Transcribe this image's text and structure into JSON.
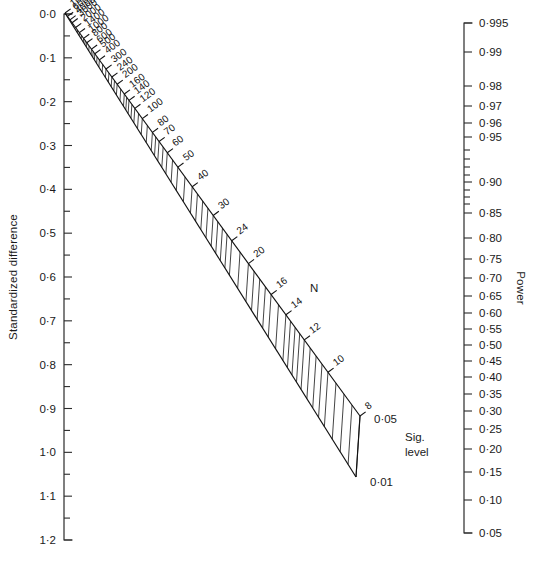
{
  "figure": {
    "type": "nomogram"
  },
  "left_axis": {
    "title": "Standardized difference",
    "y_top_px": 14,
    "y_bottom_px": 540,
    "range": [
      0.0,
      1.2
    ],
    "major_labels": [
      "0·0",
      "0·1",
      "0·2",
      "0·3",
      "0·4",
      "0·5",
      "0·6",
      "0·7",
      "0·8",
      "0·9",
      "1·0",
      "1·1",
      "1·2"
    ],
    "major_values": [
      0.0,
      0.1,
      0.2,
      0.3,
      0.4,
      0.5,
      0.6,
      0.7,
      0.8,
      0.9,
      1.0,
      1.1,
      1.2
    ],
    "minor_values": [
      0.05,
      0.15,
      0.25,
      0.35,
      0.45,
      0.55,
      0.65,
      0.75,
      0.85,
      0.95,
      1.05,
      1.15
    ]
  },
  "right_axis": {
    "title": "Power",
    "y_top_px": 23,
    "y_bottom_px": 533,
    "labeled": [
      {
        "label": "0·995",
        "value": 0.995,
        "y": 23
      },
      {
        "label": "0·99",
        "value": 0.99,
        "y": 52
      },
      {
        "label": "0·98",
        "value": 0.98,
        "y": 86
      },
      {
        "label": "0·97",
        "value": 0.97,
        "y": 106
      },
      {
        "label": "0·96",
        "value": 0.96,
        "y": 123
      },
      {
        "label": "0·95",
        "value": 0.95,
        "y": 137
      },
      {
        "label": "0·90",
        "value": 0.9,
        "y": 182
      },
      {
        "label": "0·85",
        "value": 0.85,
        "y": 213
      },
      {
        "label": "0·80",
        "value": 0.8,
        "y": 238
      },
      {
        "label": "0·75",
        "value": 0.75,
        "y": 259
      },
      {
        "label": "0·70",
        "value": 0.7,
        "y": 278
      },
      {
        "label": "0·65",
        "value": 0.65,
        "y": 296
      },
      {
        "label": "0·60",
        "value": 0.6,
        "y": 313
      },
      {
        "label": "0·55",
        "value": 0.55,
        "y": 329
      },
      {
        "label": "0·50",
        "value": 0.5,
        "y": 345
      },
      {
        "label": "0·45",
        "value": 0.45,
        "y": 361
      },
      {
        "label": "0·40",
        "value": 0.4,
        "y": 377
      },
      {
        "label": "0·35",
        "value": 0.35,
        "y": 394
      },
      {
        "label": "0·30",
        "value": 0.3,
        "y": 411
      },
      {
        "label": "0·25",
        "value": 0.25,
        "y": 429
      },
      {
        "label": "0·20",
        "value": 0.2,
        "y": 449
      },
      {
        "label": "0·15",
        "value": 0.15,
        "y": 472
      },
      {
        "label": "0·10",
        "value": 0.1,
        "y": 500
      },
      {
        "label": "0·05",
        "value": 0.05,
        "y": 533
      }
    ],
    "unlabeled_ticks_y": [
      150,
      159,
      167,
      175,
      190,
      197,
      204
    ]
  },
  "n_scale": {
    "axis_label": "N",
    "axis_label_x": 310,
    "axis_label_y": 290,
    "labels": [
      "10000",
      "6000",
      "4000",
      "3000",
      "2000",
      "1400",
      "1000",
      "800",
      "600",
      "500",
      "400",
      "300",
      "240",
      "200",
      "160",
      "140",
      "120",
      "100",
      "80",
      "70",
      "60",
      "50",
      "40",
      "30",
      "24",
      "20",
      "16",
      "14",
      "12",
      "10",
      "8"
    ],
    "values": [
      10000,
      6000,
      4000,
      3000,
      2000,
      1400,
      1000,
      800,
      600,
      500,
      400,
      300,
      240,
      200,
      160,
      140,
      120,
      100,
      80,
      70,
      60,
      50,
      40,
      30,
      24,
      20,
      16,
      14,
      12,
      10,
      8
    ]
  },
  "sig_level": {
    "title_line1": "Sig.",
    "title_line2": "level",
    "title_x": 405,
    "title_y": 441,
    "upper_label": "0·05",
    "upper_value": 0.05,
    "upper_x": 374,
    "upper_y": 419,
    "lower_label": "0·01",
    "lower_value": 0.01,
    "lower_x": 370,
    "lower_y": 482
  },
  "colors": {
    "ink": "#1a1a1a",
    "line": "#2b2b2b",
    "band": "#111111",
    "background": "#ffffff"
  },
  "chart_data": {
    "type": "line",
    "title": "",
    "xlabel": "",
    "ylabel": "Standardized difference",
    "legend": [],
    "series": [
      {
        "name": "Standardized difference axis",
        "values": [
          0.0,
          0.1,
          0.2,
          0.3,
          0.4,
          0.5,
          0.6,
          0.7,
          0.8,
          0.9,
          1.0,
          1.1,
          1.2
        ]
      },
      {
        "name": "Power axis",
        "values": [
          0.995,
          0.99,
          0.98,
          0.97,
          0.96,
          0.95,
          0.9,
          0.85,
          0.8,
          0.75,
          0.7,
          0.65,
          0.6,
          0.55,
          0.5,
          0.45,
          0.4,
          0.35,
          0.3,
          0.25,
          0.2,
          0.15,
          0.1,
          0.05
        ]
      },
      {
        "name": "N scale",
        "values": [
          10000,
          6000,
          4000,
          3000,
          2000,
          1400,
          1000,
          800,
          600,
          500,
          400,
          300,
          240,
          200,
          160,
          140,
          120,
          100,
          80,
          70,
          60,
          50,
          40,
          30,
          24,
          20,
          16,
          14,
          12,
          10,
          8
        ]
      },
      {
        "name": "Significance level",
        "values": [
          0.05,
          0.01
        ]
      }
    ],
    "ylim": [
      0.0,
      1.2
    ],
    "grid": false
  }
}
